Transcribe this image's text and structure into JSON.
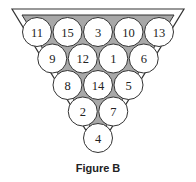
{
  "figure": {
    "caption": "Figure B",
    "colors": {
      "frame_stroke": "#333333",
      "frame_fill": "#ffffff",
      "felt_fill": "#a8a8a8",
      "ball_fill": "#ffffff",
      "ball_stroke": "#333333"
    },
    "rows": [
      [
        "11",
        "15",
        "3",
        "10",
        "13"
      ],
      [
        "9",
        "12",
        "1",
        "6"
      ],
      [
        "8",
        "14",
        "5"
      ],
      [
        "2",
        "7"
      ],
      [
        "4"
      ]
    ]
  }
}
